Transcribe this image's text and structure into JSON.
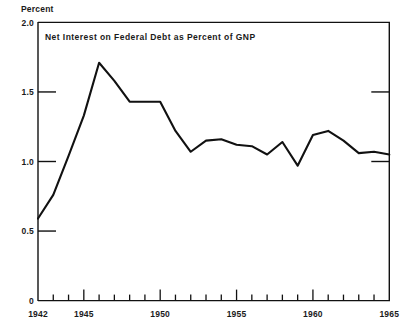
{
  "chart_data": {
    "type": "line",
    "title": "Net Interest on Federal Debt as Percent of GNP",
    "xlabel": "",
    "ylabel": "Percent",
    "ylim": [
      0,
      2.0
    ],
    "xlim": [
      1942,
      1965
    ],
    "grid": false,
    "legend_position": "none",
    "y_ticks": [
      "2.0",
      "1.5",
      "1.0",
      "0.5",
      "0"
    ],
    "y_tick_values": [
      2.0,
      1.5,
      1.0,
      0.5,
      0
    ],
    "x_ticks": [
      "1942",
      "1945",
      "1950",
      "1955",
      "1960",
      "1965"
    ],
    "x_tick_values": [
      1942,
      1945,
      1950,
      1955,
      1960,
      1965
    ],
    "x_minor_tick_values": [
      1943,
      1944,
      1946,
      1947,
      1948,
      1949,
      1951,
      1952,
      1953,
      1954,
      1956,
      1957,
      1958,
      1959,
      1961,
      1962,
      1963,
      1964
    ],
    "x": [
      1942,
      1943,
      1944,
      1945,
      1946,
      1947,
      1948,
      1949,
      1950,
      1951,
      1952,
      1953,
      1954,
      1955,
      1956,
      1957,
      1958,
      1959,
      1960,
      1961,
      1962,
      1963,
      1964,
      1965
    ],
    "values": [
      0.59,
      0.76,
      1.04,
      1.33,
      1.71,
      1.58,
      1.43,
      1.43,
      1.43,
      1.22,
      1.07,
      1.15,
      1.16,
      1.12,
      1.11,
      1.05,
      1.14,
      0.97,
      1.19,
      1.22,
      1.15,
      1.06,
      1.07,
      1.05
    ],
    "series_name": "Net interest on federal debt as percent of GNP",
    "line_color": "#111111"
  },
  "figure": {
    "unit_label": "Percent",
    "background_color": "#ffffff",
    "axis_color": "#111111"
  }
}
